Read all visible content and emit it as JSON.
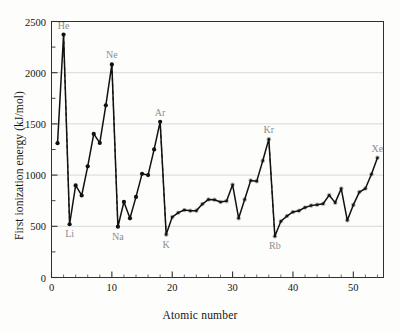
{
  "chart_data": {
    "type": "line",
    "title": "",
    "xlabel": "Atomic number",
    "ylabel": "First ionization energy (kJ/mol)",
    "xlim": [
      0,
      55
    ],
    "ylim": [
      0,
      2500
    ],
    "xticks": [
      0,
      10,
      20,
      30,
      40,
      50
    ],
    "yticks": [
      0,
      500,
      1000,
      1500,
      2000,
      2500
    ],
    "yminorticks": [
      250,
      750,
      1250,
      1750,
      2250
    ],
    "grid": "horizontal-major",
    "legend": "none",
    "series": [
      {
        "name": "First ionization energy",
        "x": [
          1,
          2,
          3,
          4,
          5,
          6,
          7,
          8,
          9,
          10,
          11,
          12,
          13,
          14,
          15,
          16,
          17,
          18,
          19,
          20,
          21,
          22,
          23,
          24,
          25,
          26,
          27,
          28,
          29,
          30,
          31,
          32,
          33,
          34,
          35,
          36,
          37,
          38,
          39,
          40,
          41,
          42,
          43,
          44,
          45,
          46,
          47,
          48,
          49,
          50,
          51,
          52,
          53,
          54
        ],
        "values": [
          1312,
          2372,
          520,
          899,
          801,
          1086,
          1402,
          1314,
          1681,
          2081,
          496,
          738,
          578,
          787,
          1012,
          1000,
          1251,
          1521,
          419,
          590,
          633,
          659,
          651,
          653,
          717,
          762,
          760,
          737,
          746,
          906,
          579,
          762,
          947,
          941,
          1140,
          1351,
          403,
          549,
          600,
          640,
          652,
          684,
          702,
          710,
          720,
          804,
          731,
          868,
          558,
          709,
          834,
          869,
          1008,
          1170
        ]
      }
    ],
    "annotations": [
      {
        "label": "He",
        "x": 2,
        "y": 2372,
        "position": "above"
      },
      {
        "label": "Ne",
        "x": 10,
        "y": 2081,
        "position": "above"
      },
      {
        "label": "Ar",
        "x": 18,
        "y": 1521,
        "position": "above"
      },
      {
        "label": "Kr",
        "x": 36,
        "y": 1351,
        "position": "above"
      },
      {
        "label": "Xe",
        "x": 54,
        "y": 1170,
        "position": "above"
      },
      {
        "label": "Li",
        "x": 3,
        "y": 520,
        "position": "below"
      },
      {
        "label": "Na",
        "x": 11,
        "y": 496,
        "position": "below"
      },
      {
        "label": "K",
        "x": 19,
        "y": 419,
        "position": "below"
      },
      {
        "label": "Rb",
        "x": 37,
        "y": 403,
        "position": "below"
      }
    ],
    "noble_gas_drops": [
      {
        "from_x": 2,
        "from_y": 2372,
        "to_x": 3,
        "to_y": 520
      },
      {
        "from_x": 10,
        "from_y": 2081,
        "to_x": 11,
        "to_y": 496
      },
      {
        "from_x": 18,
        "from_y": 1521,
        "to_x": 19,
        "to_y": 419
      },
      {
        "from_x": 36,
        "from_y": 1351,
        "to_x": 37,
        "to_y": 403
      }
    ],
    "colors": {
      "line": "#111111",
      "marker": "#111111",
      "marker_highlight": "#a8a8a8",
      "dashed_drop": "#1a1a1a",
      "grid": "#cfcfcf",
      "axis": "#303030",
      "annotation_text": "#8d8d8d",
      "tick_text": "#141414"
    }
  },
  "ticks": {
    "y": [
      "0",
      "500",
      "1000",
      "1500",
      "2000",
      "2500"
    ],
    "x": [
      "0",
      "10",
      "20",
      "30",
      "40",
      "50"
    ]
  }
}
